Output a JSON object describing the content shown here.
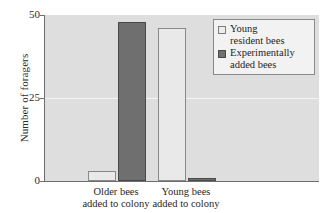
{
  "chart_data": {
    "type": "bar",
    "title": "",
    "xlabel": "",
    "ylabel": "Number of foragers",
    "ylim": [
      0,
      50
    ],
    "yticks": [
      0,
      25,
      50
    ],
    "ytick_labels": [
      "0",
      "25",
      "50"
    ],
    "grid": true,
    "legend_position": "top-right-inside",
    "categories": [
      "Older bees\nadded to colony",
      "Young bees\nadded to colony"
    ],
    "series": [
      {
        "name": "Young\nresident bees",
        "color": "#e9e9e9",
        "values": [
          3,
          46
        ]
      },
      {
        "name": "Experimentally\nadded bees",
        "color": "#6f6f6f",
        "values": [
          48,
          1
        ]
      }
    ]
  },
  "legend": {
    "entries": [
      {
        "label": "Young\nresident bees",
        "swatch": "light"
      },
      {
        "label": "Experimentally\nadded bees",
        "swatch": "dark"
      }
    ]
  },
  "axes": {
    "y_label": "Number of foragers",
    "y_ticks": [
      "50",
      "25",
      "0"
    ],
    "x_labels": [
      "Older bees\nadded to colony",
      "Young bees\nadded to colony"
    ]
  },
  "colors": {
    "plot_background": "#dedede",
    "light_series": "#e9e9e9",
    "dark_series": "#6f6f6f",
    "axis_line": "#6e6e6e",
    "gridline": "#f4f4f4",
    "text": "#1f1f1f"
  }
}
